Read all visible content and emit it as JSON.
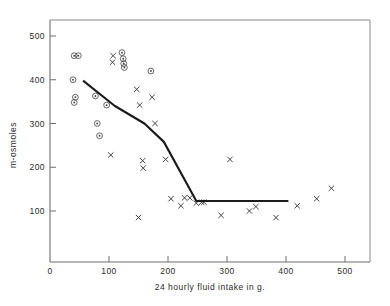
{
  "chart_data": {
    "type": "scatter",
    "title": "",
    "xlabel": "24  hourly  fluid  intake  in  g.",
    "ylabel": "m-osmoles",
    "xlim": [
      0,
      540
    ],
    "ylim": [
      0,
      530
    ],
    "xticks": [
      0,
      100,
      200,
      300,
      400,
      500
    ],
    "xtick_labels": [
      "0",
      "100",
      "200",
      "300",
      "400",
      "500"
    ],
    "yticks": [
      100,
      200,
      300,
      400,
      500
    ],
    "ytick_labels": [
      "100",
      "200",
      "300",
      "400",
      "500"
    ],
    "grid": false,
    "legend": null,
    "series": [
      {
        "name": "circled-dot-group",
        "marker": "circled-dot",
        "points": [
          [
            41,
            455
          ],
          [
            48,
            455
          ],
          [
            39,
            400
          ],
          [
            43,
            360
          ],
          [
            41,
            348
          ],
          [
            77,
            363
          ],
          [
            80,
            300
          ],
          [
            84,
            272
          ],
          [
            96,
            342
          ],
          [
            122,
            462
          ],
          [
            124,
            448
          ],
          [
            125,
            437
          ],
          [
            126,
            428
          ],
          [
            171,
            420
          ]
        ]
      },
      {
        "name": "cross-group",
        "marker": "cross",
        "points": [
          [
            107,
            455
          ],
          [
            106,
            440
          ],
          [
            103,
            228
          ],
          [
            147,
            378
          ],
          [
            152,
            342
          ],
          [
            157,
            215
          ],
          [
            158,
            198
          ],
          [
            173,
            360
          ],
          [
            178,
            300
          ],
          [
            150,
            85
          ],
          [
            196,
            218
          ],
          [
            205,
            128
          ],
          [
            228,
            130
          ],
          [
            237,
            130
          ],
          [
            222,
            112
          ],
          [
            261,
            120
          ],
          [
            305,
            218
          ],
          [
            248,
            118
          ],
          [
            257,
            120
          ],
          [
            290,
            90
          ],
          [
            338,
            100
          ],
          [
            349,
            110
          ],
          [
            383,
            85
          ],
          [
            419,
            112
          ],
          [
            452,
            128
          ],
          [
            477,
            152
          ]
        ]
      }
    ],
    "fit_line": {
      "name": "fitted-response-curve",
      "points": [
        [
          56,
          398
        ],
        [
          110,
          340
        ],
        [
          160,
          300
        ],
        [
          193,
          258
        ],
        [
          248,
          123
        ],
        [
          404,
          123
        ]
      ]
    }
  }
}
